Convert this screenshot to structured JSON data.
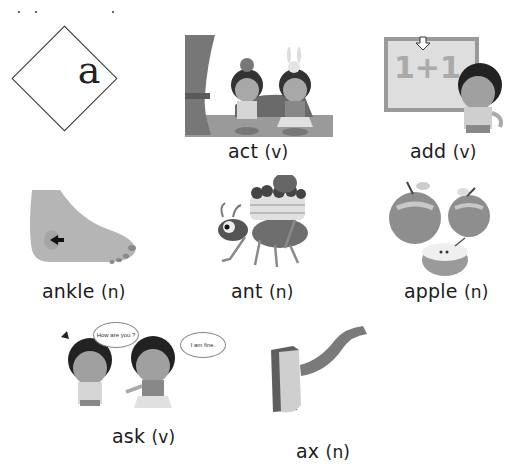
{
  "page": {
    "header_letter": "a",
    "top_strip_text": ""
  },
  "entries": [
    {
      "word": "act",
      "pos": "(v)",
      "illustration": "two-children-acting-on-stage"
    },
    {
      "word": "add",
      "pos": "(v)",
      "illustration": "boy-with-1-plus-1-board"
    },
    {
      "word": "ankle",
      "pos": "(n)",
      "illustration": "foot-with-arrow-at-ankle"
    },
    {
      "word": "ant",
      "pos": "(n)",
      "illustration": "ant-carrying-cake"
    },
    {
      "word": "apple",
      "pos": "(n)",
      "illustration": "two-apples-and-half-apple"
    },
    {
      "word": "ask",
      "pos": "(v)",
      "illustration": "two-children-talking"
    },
    {
      "word": "ax",
      "pos": "(n)",
      "illustration": "axe"
    }
  ],
  "speech_bubbles": {
    "question": "How are you ?",
    "answer": "I am fine."
  },
  "colors": {
    "text": "#1b1b1b",
    "illustration_gray": "#8a8a8a",
    "light_gray": "#c8c8c8",
    "dark_gray": "#555555"
  }
}
